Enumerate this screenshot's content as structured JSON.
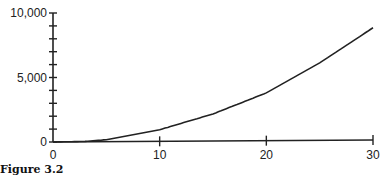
{
  "caption": "Figure 3.2",
  "chart_data": {
    "type": "line",
    "title": "",
    "xlabel": "",
    "ylabel": "",
    "xlim": [
      0,
      30
    ],
    "ylim": [
      0,
      10000
    ],
    "grid": false,
    "legend": null,
    "x_ticks": [
      0,
      10,
      20,
      30
    ],
    "x_tick_labels": [
      "0",
      "10",
      "20",
      "30"
    ],
    "y_major_ticks": [
      0,
      5000,
      10000
    ],
    "y_tick_labels": [
      "0",
      "5,000",
      "10,000"
    ],
    "y_minor_tick_step": 1000,
    "series": [
      {
        "name": "curve",
        "x": [
          0,
          3,
          5,
          10,
          15,
          20,
          25,
          30
        ],
        "y": [
          0,
          30,
          150,
          900,
          2100,
          3700,
          6000,
          8700
        ]
      }
    ]
  },
  "colors": {
    "axis": "#222222",
    "line": "#222222"
  }
}
